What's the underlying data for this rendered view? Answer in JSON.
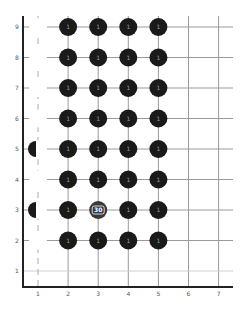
{
  "board": {
    "name": "stone-grid-board",
    "columns": [
      "1",
      "2",
      "3",
      "4",
      "5",
      "6",
      "7"
    ],
    "rows": [
      "1",
      "2",
      "3",
      "4",
      "5",
      "6",
      "7",
      "8",
      "9"
    ],
    "colors": {
      "stone": "#1a1a1a",
      "stone_special": "#3a3a3a",
      "grid": "#9a9a9a",
      "grid_light": "#cfcfcf",
      "axis": "#222222",
      "ghost": "#ffffff",
      "dash": "#aaaaaa"
    }
  },
  "stones": [
    {
      "col": 2,
      "row": 9,
      "label": "1"
    },
    {
      "col": 3,
      "row": 9,
      "label": "1"
    },
    {
      "col": 4,
      "row": 9,
      "label": "1"
    },
    {
      "col": 5,
      "row": 9,
      "label": "1"
    },
    {
      "col": 2,
      "row": 8,
      "label": "1"
    },
    {
      "col": 3,
      "row": 8,
      "label": "1"
    },
    {
      "col": 4,
      "row": 8,
      "label": "1"
    },
    {
      "col": 5,
      "row": 8,
      "label": "1"
    },
    {
      "col": 2,
      "row": 7,
      "label": "1"
    },
    {
      "col": 3,
      "row": 7,
      "label": "1"
    },
    {
      "col": 4,
      "row": 7,
      "label": "1"
    },
    {
      "col": 5,
      "row": 7,
      "label": "1"
    },
    {
      "col": 2,
      "row": 6,
      "label": "1"
    },
    {
      "col": 3,
      "row": 6,
      "label": "1"
    },
    {
      "col": 4,
      "row": 6,
      "label": "1"
    },
    {
      "col": 5,
      "row": 6,
      "label": "1"
    },
    {
      "col": 2,
      "row": 5,
      "label": "1"
    },
    {
      "col": 3,
      "row": 5,
      "label": "1"
    },
    {
      "col": 4,
      "row": 5,
      "label": "1"
    },
    {
      "col": 5,
      "row": 5,
      "label": "1"
    },
    {
      "col": 2,
      "row": 4,
      "label": "1"
    },
    {
      "col": 3,
      "row": 4,
      "label": "1"
    },
    {
      "col": 4,
      "row": 4,
      "label": "1"
    },
    {
      "col": 5,
      "row": 4,
      "label": "1"
    },
    {
      "col": 2,
      "row": 3,
      "label": "1"
    },
    {
      "col": 3,
      "row": 3,
      "label": "30",
      "special": true
    },
    {
      "col": 4,
      "row": 3,
      "label": "1"
    },
    {
      "col": 5,
      "row": 3,
      "label": "1"
    },
    {
      "col": 2,
      "row": 2,
      "label": "1"
    },
    {
      "col": 3,
      "row": 2,
      "label": "1"
    },
    {
      "col": 4,
      "row": 2,
      "label": "1"
    },
    {
      "col": 5,
      "row": 2,
      "label": "1"
    }
  ],
  "ghost_stones": [
    {
      "col": 1,
      "row": 9
    },
    {
      "col": 1,
      "row": 8
    },
    {
      "col": 1,
      "row": 7
    },
    {
      "col": 1,
      "row": 6
    },
    {
      "col": 1,
      "row": 5
    },
    {
      "col": 1,
      "row": 4
    },
    {
      "col": 1,
      "row": 3
    },
    {
      "col": 1,
      "row": 2
    }
  ],
  "half_stones": [
    {
      "col": 1,
      "row": 5
    },
    {
      "col": 1,
      "row": 3
    }
  ]
}
